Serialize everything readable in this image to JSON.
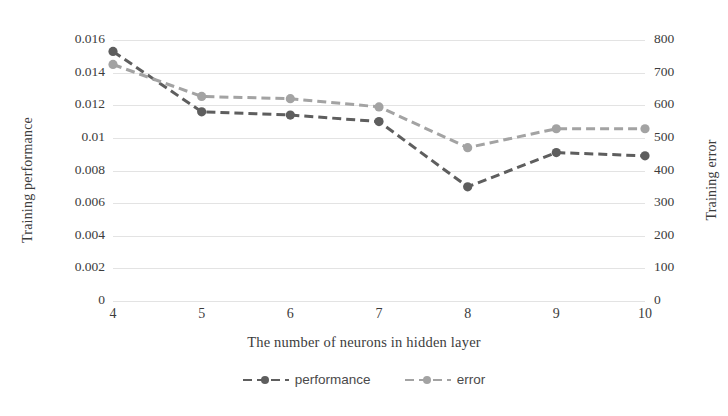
{
  "chart_data": {
    "type": "line",
    "title": "",
    "xlabel": "The number of neurons in hidden layer",
    "categories": [
      4,
      5,
      6,
      7,
      8,
      9,
      10
    ],
    "x": [
      4,
      5,
      6,
      7,
      8,
      9,
      10
    ],
    "grid": true,
    "legend_position": "bottom",
    "axes": {
      "left": {
        "label": "Training performance",
        "ticks": [
          "0",
          "0.002",
          "0.004",
          "0.006",
          "0.008",
          "0.01",
          "0.012",
          "0.014",
          "0.016"
        ],
        "tick_values": [
          0,
          0.002,
          0.004,
          0.006,
          0.008,
          0.01,
          0.012,
          0.014,
          0.016
        ],
        "lim": [
          0,
          0.016
        ]
      },
      "right": {
        "label": "Training error",
        "ticks": [
          "0",
          "100",
          "200",
          "300",
          "400",
          "500",
          "600",
          "700",
          "800"
        ],
        "tick_values": [
          0,
          100,
          200,
          300,
          400,
          500,
          600,
          700,
          800
        ],
        "lim": [
          0,
          800
        ]
      },
      "x": {
        "ticks": [
          "4",
          "5",
          "6",
          "7",
          "8",
          "9",
          "10"
        ],
        "lim": [
          4,
          10
        ]
      }
    },
    "series": [
      {
        "name": "performance",
        "axis": "left",
        "color": "#5e5e5e",
        "style": "dashed",
        "marker": "circle",
        "values": [
          0.0153,
          0.0116,
          0.0114,
          0.011,
          0.007,
          0.0091,
          0.0089
        ]
      },
      {
        "name": "error",
        "axis": "right",
        "color": "#a3a3a3",
        "style": "dashed",
        "marker": "circle",
        "values": [
          725,
          627,
          620,
          595,
          470,
          528,
          528
        ]
      }
    ]
  },
  "legend": {
    "items": [
      {
        "label": "performance",
        "color": "#5e5e5e"
      },
      {
        "label": "error",
        "color": "#a3a3a3"
      }
    ]
  },
  "colors": {
    "background": "#ffffff",
    "gridline": "#e3e3e3",
    "text": "#3c3c3c",
    "performance": "#5e5e5e",
    "error": "#a3a3a3"
  }
}
